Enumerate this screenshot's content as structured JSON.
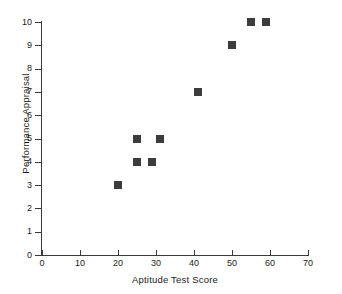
{
  "chart_data": {
    "type": "scatter",
    "title": "",
    "xlabel": "Aptitude Test Score",
    "ylabel": "Performance Appraisal",
    "xlim": [
      0,
      70
    ],
    "ylim": [
      0,
      10
    ],
    "xticks": [
      0,
      10,
      20,
      30,
      40,
      50,
      60,
      70
    ],
    "yticks": [
      0,
      1,
      2,
      3,
      4,
      5,
      6,
      7,
      8,
      9,
      10
    ],
    "grid": false,
    "legend": null,
    "marker": "square",
    "marker_color": "#3c3c3c",
    "points": [
      {
        "x": 20,
        "y": 3
      },
      {
        "x": 25,
        "y": 4
      },
      {
        "x": 29,
        "y": 4
      },
      {
        "x": 25,
        "y": 5
      },
      {
        "x": 31,
        "y": 5
      },
      {
        "x": 41,
        "y": 7
      },
      {
        "x": 50,
        "y": 9
      },
      {
        "x": 55,
        "y": 10
      },
      {
        "x": 59,
        "y": 10
      }
    ],
    "x": [
      20,
      25,
      29,
      25,
      31,
      41,
      50,
      55,
      59
    ],
    "values": [
      3,
      4,
      4,
      5,
      5,
      7,
      9,
      10,
      10
    ]
  },
  "axes": {
    "x_title": "Aptitude Test Score",
    "y_title": "Performance Appraisal"
  },
  "colors": {
    "marker": "#3c3c3c",
    "axis": "#3a3a3a",
    "text": "#1a1a1a",
    "background": "#ffffff"
  }
}
